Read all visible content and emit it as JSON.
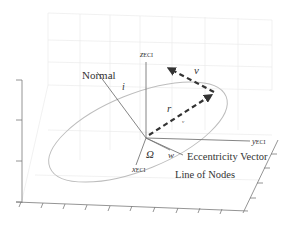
{
  "diagram": {
    "labels": {
      "z_axis": "z",
      "z_axis_sub": "ECI",
      "y_axis": "y",
      "y_axis_sub": "ECI",
      "x_axis": "x",
      "x_axis_sub": "ECI",
      "normal": "Normal",
      "inclination": "i",
      "velocity": "v",
      "position": "r",
      "position_sub": "v",
      "raan": "Ω",
      "arg_periapsis": "w",
      "eccentricity_vector": "Eccentricity Vector",
      "line_of_nodes": "Line of Nodes"
    },
    "colors": {
      "vector": "#333333",
      "axis": "#777777",
      "orbit": "#bdbdbd",
      "grid": "#e8e8e8",
      "text": "#333333"
    }
  }
}
